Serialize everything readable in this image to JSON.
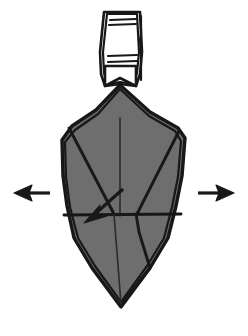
{
  "figure": {
    "caption": "",
    "background_color": "#ffffff",
    "canvas": {
      "width": 248,
      "height": 336
    }
  },
  "colors": {
    "paper_front": "#6e6e6e",
    "paper_back": "#ffffff",
    "ink": "#17181a",
    "background": "#ffffff"
  },
  "shapes": {
    "main_body": {
      "name": "folded-paper-body",
      "fill": "#6e6e6e",
      "points": "120,85 150,112 178,128 185,138 182,176 176,206 168,238 150,268 121,307 92,268 74,238 67,206 63,176 62,140 72,126 96,110"
    },
    "body_outline_accent": {
      "name": "folded-paper-body-edge-highlight",
      "points": "120,89 149,116 175,131 181,141 178,177 172,207 164,238 147,266 121,302 95,266 78,238 70,207 66,177 65,142 75,130 98,114"
    },
    "top_strip": {
      "name": "white-paper-strip",
      "points": "104,12 140,12 142,52 140,74 136,86 120,84 105,86 101,74 100,52"
    },
    "top_strip_inner": {
      "name": "white-paper-strip-inner-edge",
      "points": "107,14 137,14 139,52 137,73 133,84 120,82 108,84 104,73 103,52"
    },
    "strip_notch": {
      "name": "strip-bottom-notch",
      "points": "105,66 136,66 136,86 120,78 105,86"
    }
  },
  "fold_lines": [
    {
      "name": "center-vertical-crease",
      "d": "M 120,118 L 120,216",
      "weight": "thin"
    },
    {
      "name": "left-upper-diagonal-crease",
      "d": "M 69,128 L 114,214",
      "weight": "thick"
    },
    {
      "name": "right-upper-diagonal-crease",
      "d": "M 179,131 L 137,214",
      "weight": "thick"
    },
    {
      "name": "horizontal-mid-crease",
      "d": "M 64,215 L 181,214",
      "weight": "thick"
    },
    {
      "name": "lower-right-crease",
      "d": "M 136,214 L 139,232 L 150,268 L 121,304",
      "weight": "thick"
    },
    {
      "name": "lower-left-crease",
      "d": "M 114,214 L 121,304",
      "weight": "thin"
    },
    {
      "name": "strip-rule-upper-1",
      "d": "M 110,20 L 136,19",
      "weight": "rule"
    },
    {
      "name": "strip-rule-upper-2",
      "d": "M 109,25 L 136,24",
      "weight": "rule"
    },
    {
      "name": "strip-rule-lower-1",
      "d": "M 108,56 L 137,55",
      "weight": "rule"
    },
    {
      "name": "strip-rule-lower-2",
      "d": "M 108,62 L 137,61",
      "weight": "rule"
    },
    {
      "name": "strip-right-edge-crease",
      "d": "M 141,16 L 141,34 L 140,40 L 141,50 L 141,80",
      "weight": "rule"
    }
  ],
  "arrows": [
    {
      "name": "left-pull-arrow",
      "direction": "left",
      "label": "",
      "shaft": "M 50,193 L 22,193",
      "head": "14,193 32,185 29,193 32,201"
    },
    {
      "name": "right-pull-arrow",
      "direction": "right",
      "label": "",
      "shaft": "M 198,193 L 226,193",
      "head": "234,193 216,185 219,193 216,201"
    },
    {
      "name": "fold-direction-arrow",
      "direction": "down-left",
      "label": "",
      "shaft": "M 123,189 L 95,214",
      "head": "84,223 100,205 98,215 107,216"
    }
  ],
  "legend": {
    "visible": false,
    "items": []
  }
}
